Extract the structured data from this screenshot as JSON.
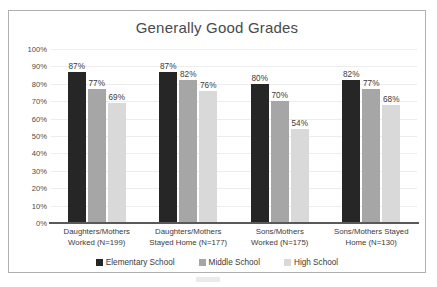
{
  "chart_data": {
    "type": "bar",
    "title": "Generally Good Grades",
    "xlabel": "",
    "ylabel": "",
    "ylim": [
      0,
      100
    ],
    "ytick_labels": [
      "100%",
      "90%",
      "80%",
      "70%",
      "60%",
      "50%",
      "40%",
      "30%",
      "20%",
      "10%",
      "0%"
    ],
    "ytick_values": [
      100,
      90,
      80,
      70,
      60,
      50,
      40,
      30,
      20,
      10,
      0
    ],
    "grid": true,
    "legend_position": "bottom",
    "categories": [
      "Daughters/Mothers Worked (N=199)",
      "Daughters/Mothers Stayed Home (N=177)",
      "Sons/Mothers Worked (N=175)",
      "Sons/Mothers Stayed Home (N=130)"
    ],
    "category_lines": [
      [
        "Daughters/Mothers",
        "Worked (N=199)"
      ],
      [
        "Daughters/Mothers",
        "Stayed Home (N=177)"
      ],
      [
        "Sons/Mothers",
        "Worked (N=175)"
      ],
      [
        "Sons/Mothers Stayed",
        "Home (N=130)"
      ]
    ],
    "series": [
      {
        "name": "Elementary School",
        "color": "#262626",
        "values": [
          87,
          87,
          80,
          82
        ],
        "labels": [
          "87%",
          "87%",
          "80%",
          "82%"
        ]
      },
      {
        "name": "Middle School",
        "color": "#a6a6a6",
        "values": [
          77,
          82,
          70,
          77
        ],
        "labels": [
          "77%",
          "82%",
          "70%",
          "77%"
        ]
      },
      {
        "name": "High School",
        "color": "#d9d9d9",
        "values": [
          69,
          76,
          54,
          68
        ],
        "labels": [
          "69%",
          "76%",
          "54%",
          "68%"
        ]
      }
    ]
  },
  "colors": {
    "elementary": "#262626",
    "middle": "#a6a6a6",
    "high": "#d9d9d9",
    "axis": "#595959",
    "grid": "#ededed",
    "border": "#b0b0b0",
    "text": "#3a3a3a",
    "title": "#4a4a4a"
  }
}
